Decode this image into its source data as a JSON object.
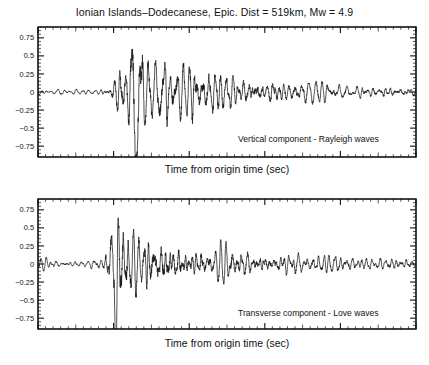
{
  "figure": {
    "title": "Ionian Islands–Dodecanese, Epic. Dist = 519km, Mw = 4.9",
    "background_color": "#ffffff",
    "trace_color": "#1a1a1a",
    "axis_color": "#111111"
  },
  "panels": [
    {
      "id": "vertical",
      "annotation": "Vertical component - Rayleigh waves",
      "xlabel": "Time from origin time (sec)",
      "xticks": [
        "0",
        "100",
        "200",
        "300",
        "400",
        "500"
      ],
      "yticks": [
        "0.75",
        "0.5",
        "0.25",
        "0",
        "−0.25",
        "−0.5",
        "−0.75"
      ]
    },
    {
      "id": "transverse",
      "annotation": "Transverse component - Love waves",
      "xlabel": "Time from origin time (sec)",
      "xticks": [
        "0",
        "100",
        "200",
        "300",
        "400",
        "500"
      ],
      "yticks": [
        "0.75",
        "0.5",
        "0.25",
        "0",
        "−0.25",
        "−0.5",
        "−0.75"
      ]
    }
  ],
  "chart_data": {
    "type": "line",
    "title": "Ionian Islands–Dodecanese, Epic. Dist = 519km, Mw = 4.9",
    "xlabel": "Time from origin time (sec)",
    "ylabel": "",
    "xlim": [
      0,
      500
    ],
    "ylim": [
      -0.9,
      0.9
    ],
    "xticks": [
      0,
      100,
      200,
      300,
      400,
      500
    ],
    "yticks": [
      -0.75,
      -0.5,
      -0.25,
      0,
      0.25,
      0.5,
      0.75
    ],
    "xtick_minor_step": 10,
    "ytick_minor_step": 0.05,
    "grid": false,
    "legend": "none",
    "subplots": [
      {
        "name": "Vertical component - Rayleigh waves",
        "annotation": "Vertical component - Rayleigh waves",
        "metadata": {
          "event": "Ionian Islands–Dodecanese",
          "epicentral_distance_km": 519,
          "magnitude_mw": 4.9,
          "component": "vertical",
          "wave_type": "Rayleigh"
        },
        "envelope_description": "low-amplitude pre-arrival noise (~±0.05) to ~95 s; Rayleigh wave train onset ~100 s growing to clipped maximum near 130 s (|a| > 0.9); strong coda 140-260 s with peaks ~0.45; gradual decay to ~0.08 by 500 s",
        "seed": 1337,
        "dominant_period_sec": 7.5,
        "onset_sec": 98,
        "peak_sec": 130,
        "peak_value": -1.05,
        "noise_amplitude": 0.045,
        "coda_decay_tau_sec": 130,
        "envelope": [
          {
            "t": 0,
            "a": 0.045
          },
          {
            "t": 40,
            "a": 0.04
          },
          {
            "t": 80,
            "a": 0.05
          },
          {
            "t": 95,
            "a": 0.07
          },
          {
            "t": 100,
            "a": 0.22
          },
          {
            "t": 110,
            "a": 0.4
          },
          {
            "t": 120,
            "a": 0.52
          },
          {
            "t": 130,
            "a": 0.95
          },
          {
            "t": 140,
            "a": 0.62
          },
          {
            "t": 150,
            "a": 0.48
          },
          {
            "t": 165,
            "a": 0.52
          },
          {
            "t": 180,
            "a": 0.45
          },
          {
            "t": 200,
            "a": 0.46
          },
          {
            "t": 220,
            "a": 0.38
          },
          {
            "t": 245,
            "a": 0.34
          },
          {
            "t": 270,
            "a": 0.26
          },
          {
            "t": 300,
            "a": 0.22
          },
          {
            "t": 330,
            "a": 0.18
          },
          {
            "t": 360,
            "a": 0.15
          },
          {
            "t": 400,
            "a": 0.12
          },
          {
            "t": 440,
            "a": 0.1
          },
          {
            "t": 470,
            "a": 0.1
          },
          {
            "t": 500,
            "a": 0.08
          }
        ]
      },
      {
        "name": "Transverse component - Love waves",
        "annotation": "Transverse component - Love waves",
        "metadata": {
          "event": "Ionian Islands–Dodecanese",
          "epicentral_distance_km": 519,
          "magnitude_mw": 4.9,
          "component": "transverse",
          "wave_type": "Love"
        },
        "envelope_description": "quiet noise (~±0.04) to ~85 s; Love wave onset ~90 s with clipped maximum near 103 s (|a| > 0.9); energetic coda 110-200 s peaks ~0.42; slow decay to ~0.08 by 500 s",
        "seed": 4242,
        "dominant_period_sec": 6.5,
        "onset_sec": 88,
        "peak_sec": 103,
        "peak_value": -1.05,
        "noise_amplitude": 0.04,
        "coda_decay_tau_sec": 140,
        "envelope": [
          {
            "t": 0,
            "a": 0.1
          },
          {
            "t": 15,
            "a": 0.06
          },
          {
            "t": 40,
            "a": 0.05
          },
          {
            "t": 70,
            "a": 0.06
          },
          {
            "t": 85,
            "a": 0.09
          },
          {
            "t": 90,
            "a": 0.25
          },
          {
            "t": 97,
            "a": 0.5
          },
          {
            "t": 103,
            "a": 0.95
          },
          {
            "t": 112,
            "a": 0.6
          },
          {
            "t": 125,
            "a": 0.42
          },
          {
            "t": 140,
            "a": 0.4
          },
          {
            "t": 155,
            "a": 0.44
          },
          {
            "t": 170,
            "a": 0.36
          },
          {
            "t": 190,
            "a": 0.3
          },
          {
            "t": 215,
            "a": 0.26
          },
          {
            "t": 245,
            "a": 0.24
          },
          {
            "t": 275,
            "a": 0.2
          },
          {
            "t": 310,
            "a": 0.17
          },
          {
            "t": 345,
            "a": 0.15
          },
          {
            "t": 385,
            "a": 0.13
          },
          {
            "t": 425,
            "a": 0.11
          },
          {
            "t": 465,
            "a": 0.1
          },
          {
            "t": 500,
            "a": 0.08
          }
        ]
      }
    ]
  }
}
